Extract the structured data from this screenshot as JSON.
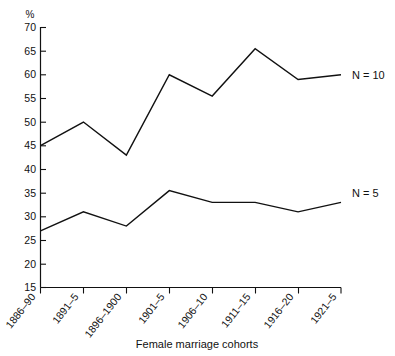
{
  "chart_data": {
    "type": "line",
    "title": "",
    "xlabel": "Female marriage cohorts",
    "ylabel": "%",
    "categories": [
      "1886–90",
      "1891–5",
      "1896–1900",
      "1901–5",
      "1906–10",
      "1911–15",
      "1916–20",
      "1921–5"
    ],
    "series": [
      {
        "name": "N = 10",
        "label": "N = 10",
        "values": [
          45,
          50,
          43,
          60,
          55.5,
          65.5,
          59,
          60
        ]
      },
      {
        "name": "N = 5",
        "label": "N = 5",
        "values": [
          27,
          31,
          28,
          35.5,
          33,
          33,
          31,
          33
        ]
      }
    ],
    "ylim": [
      15,
      70
    ],
    "ytick_values": [
      15,
      20,
      25,
      30,
      35,
      40,
      45,
      50,
      55,
      60,
      65,
      70
    ],
    "ytick_labels": [
      "15",
      "20",
      "25",
      "30",
      "35",
      "40",
      "45",
      "50",
      "55",
      "60",
      "65",
      "70"
    ],
    "grid": false,
    "legend_position": "inline-right",
    "line_color": "#111111",
    "background_color": "#ffffff"
  },
  "axes": {
    "y_unit_symbol": "%",
    "x_axis_title": "Female marriage cohorts",
    "x_label_rotation_degrees": -52
  },
  "annotations": {
    "series_1_label": "N = 10",
    "series_2_label": "N = 5"
  }
}
